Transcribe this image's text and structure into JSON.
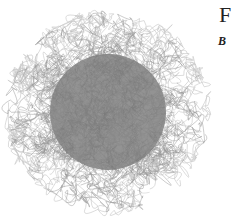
{
  "figure": {
    "center": [
      108,
      112
    ],
    "core_radius": 62,
    "outer_radius": 100,
    "core_color": "#858585",
    "stroke_color": "#9a9a9a",
    "light_stroke_color": "#c8c8c8",
    "background": "#ffffff"
  },
  "labels": {
    "panel_title_partial": "F",
    "panel_subtitle_partial": "B"
  }
}
